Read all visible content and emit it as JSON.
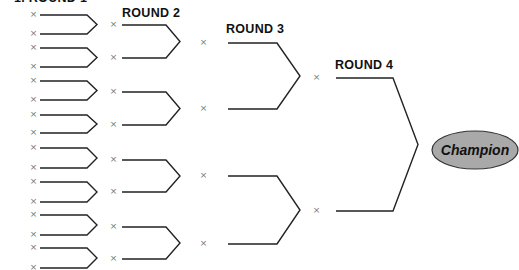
{
  "bracket": {
    "rounds": [
      {
        "label": "1.  ROUND 1",
        "slots": 16
      },
      {
        "label": "ROUND 2",
        "slots": 8
      },
      {
        "label": "ROUND 3",
        "slots": 4
      },
      {
        "label": "ROUND 4",
        "slots": 2
      }
    ],
    "slot_marker": "×",
    "champion": {
      "label": "Champion",
      "fill": "#a9a9a9",
      "stroke": "#333333"
    },
    "line_color": "#222222"
  }
}
